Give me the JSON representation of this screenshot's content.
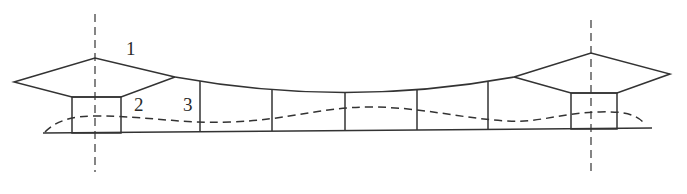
{
  "diagram": {
    "type": "cross-section",
    "labels": [
      {
        "id": "1",
        "text": "1",
        "x": 126,
        "y": 55
      },
      {
        "id": "2",
        "text": "2",
        "x": 134,
        "y": 111
      },
      {
        "id": "3",
        "text": "3",
        "x": 183,
        "y": 111
      }
    ],
    "colors": {
      "line": "#333333",
      "background": "#ffffff"
    }
  }
}
